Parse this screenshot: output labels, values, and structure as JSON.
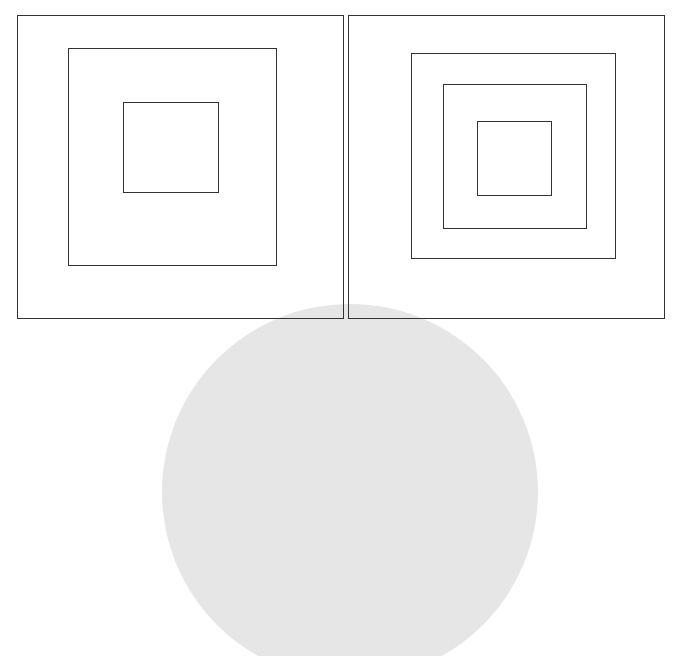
{
  "figure": {
    "panels": [
      {
        "name": "left",
        "nested_square_count": 3
      },
      {
        "name": "right",
        "nested_square_count": 4
      }
    ],
    "colors": {
      "stroke": "#333333",
      "background": "#ffffff",
      "overlay_shape": "#e6e6e6"
    }
  }
}
